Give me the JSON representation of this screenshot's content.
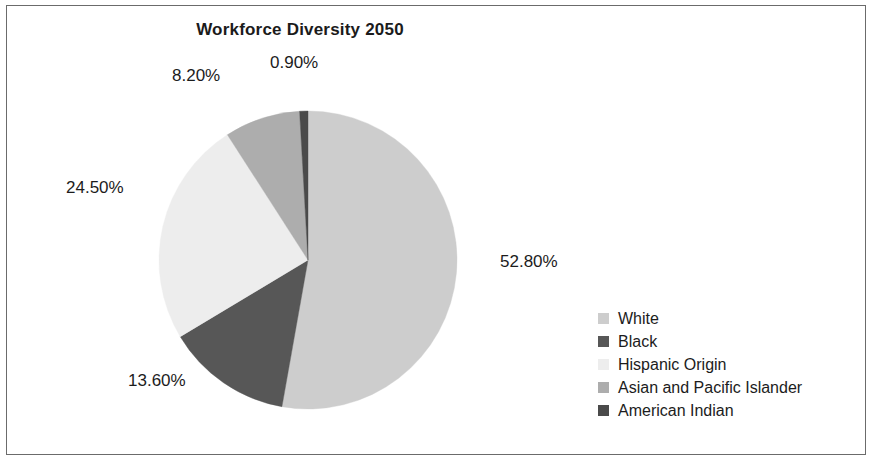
{
  "chart_data": {
    "type": "pie",
    "title": "Workforce Diversity 2050",
    "categories": [
      "White",
      "Black",
      "Hispanic Origin",
      "Asian and Pacific Islander",
      "American Indian"
    ],
    "values": [
      52.8,
      13.6,
      24.5,
      8.2,
      0.9
    ],
    "data_labels": [
      "52.80%",
      "13.60%",
      "24.50%",
      "8.20%",
      "0.90%"
    ],
    "colors": [
      "#cdcdcd",
      "#575757",
      "#ededed",
      "#adadad",
      "#4a4a4a"
    ],
    "start_angle_deg": 0,
    "direction": "clockwise",
    "legend_position": "right",
    "grid": false,
    "xlabel": "",
    "ylabel": ""
  },
  "frame": {
    "border_color": "#6b6b6b",
    "background": "#ffffff"
  }
}
